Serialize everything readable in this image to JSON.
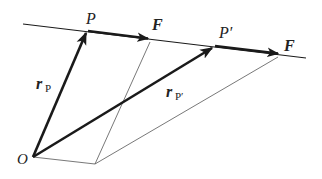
{
  "diagram": {
    "type": "vector-mechanics",
    "colors": {
      "stroke": "#1a1a1a",
      "thin": "#555555",
      "background": "#ffffff"
    },
    "labels": {
      "point_P": "P",
      "point_P_prime": "P′",
      "force_1": "F",
      "force_2": "F",
      "origin": "O",
      "r_P_main": "r",
      "r_P_sub": "P",
      "r_Pp_main": "r",
      "r_Pp_sub": "P′"
    },
    "points": {
      "O": [
        33,
        157
      ],
      "P": [
        88,
        31
      ],
      "P_prime": [
        215,
        46
      ],
      "F1_tip": [
        148,
        39
      ],
      "F2_tip": [
        278,
        54
      ],
      "base": [
        95,
        164
      ]
    },
    "line_of_action": {
      "start": [
        23,
        24
      ],
      "end": [
        306,
        58
      ]
    }
  }
}
